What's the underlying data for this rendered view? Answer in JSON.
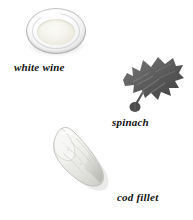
{
  "page": {
    "background_color": "#ffffff",
    "width": 193,
    "height": 220,
    "kind": "ingredient-illustration-plate"
  },
  "items": [
    {
      "id": "white-wine",
      "caption": "white wine",
      "icon": "wine-glass-top-view-icon",
      "colors": {
        "glass_rim": "#bdbdbd",
        "glass_body": "#f2f2f2",
        "liquid": "#f0eee2",
        "shadow": "#7d7d7d"
      }
    },
    {
      "id": "spinach",
      "caption": "spinach",
      "icon": "spinach-leaf-icon",
      "colors": {
        "leaf_dark": "#4a4a4a",
        "leaf_mid": "#6b6b6b",
        "leaf_light": "#8a8a8a",
        "stem": "#5a5a5a"
      }
    },
    {
      "id": "cod-fillet",
      "caption": "cod fillet",
      "icon": "cod-fillet-icon",
      "colors": {
        "flesh_light": "#f7f7f5",
        "flesh_mid": "#e6e6e2",
        "flesh_shadow": "#c8c8c4",
        "outline": "#b4b4b0"
      }
    }
  ]
}
